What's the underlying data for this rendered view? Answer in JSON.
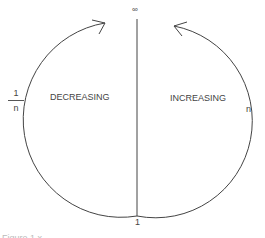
{
  "diagram": {
    "top_label": "∞",
    "bottom_label": "1",
    "left_region_label": "DECREASING",
    "right_region_label": "INCREASING",
    "left_axis_label": {
      "numerator": "1",
      "denominator": "n"
    },
    "right_axis_label": "n",
    "caption": "Figure 1.x"
  }
}
